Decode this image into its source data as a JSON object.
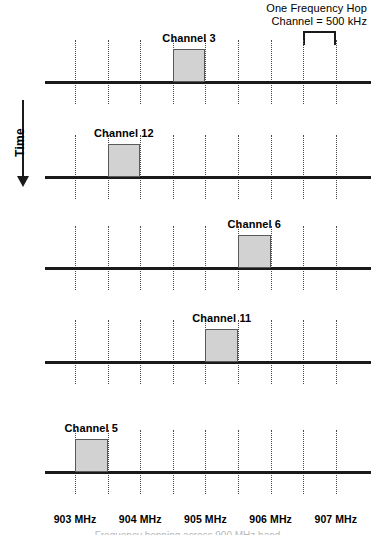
{
  "figure": {
    "title_caption": "Frequency hopping across 900 MHz band"
  },
  "legend": {
    "line1": "One Frequency Hop",
    "line2": "Channel = 500 kHz",
    "bracket_name": "hop-width-bracket"
  },
  "time_axis": {
    "label": "Time",
    "direction": "down"
  },
  "frequency_axis": {
    "unit": "MHz",
    "ticks": [
      {
        "label": "903 MHz",
        "value": 903
      },
      {
        "label": "904 MHz",
        "value": 904
      },
      {
        "label": "905 MHz",
        "value": 905
      },
      {
        "label": "906 MHz",
        "value": 906
      },
      {
        "label": "907 MHz",
        "value": 907
      }
    ]
  },
  "chart_data": {
    "type": "bar",
    "xlabel": "Frequency (MHz)",
    "ylabel": "Time",
    "xlim": [
      902.75,
      907.25
    ],
    "grid": true,
    "legend_position": "top-right",
    "categories": [
      "Channel 3",
      "Channel 12",
      "Channel 6",
      "Channel 11",
      "Channel 5"
    ],
    "annotations": [
      "One Frequency Hop",
      "Channel = 500 kHz"
    ],
    "slot_width_khz": 500,
    "series": [
      {
        "name": "Frequency hop sequence",
        "points": [
          {
            "time_step": 1,
            "channel": 3,
            "label": "Channel 3",
            "freq_start": 904.5,
            "freq_end": 905.0
          },
          {
            "time_step": 2,
            "channel": 12,
            "label": "Channel 12",
            "freq_start": 903.5,
            "freq_end": 904.0
          },
          {
            "time_step": 3,
            "channel": 6,
            "label": "Channel 6",
            "freq_start": 905.5,
            "freq_end": 906.0
          },
          {
            "time_step": 4,
            "channel": 11,
            "label": "Channel 11",
            "freq_start": 905.0,
            "freq_end": 905.5
          },
          {
            "time_step": 5,
            "channel": 5,
            "label": "Channel 5",
            "freq_start": 903.0,
            "freq_end": 903.5
          }
        ]
      }
    ]
  },
  "rows": [
    {
      "label": "Channel 3",
      "slot": 4
    },
    {
      "label": "Channel 12",
      "slot": 2
    },
    {
      "label": "Channel 6",
      "slot": 6
    },
    {
      "label": "Channel 11",
      "slot": 5
    },
    {
      "label": "Channel 5",
      "slot": 1
    }
  ]
}
